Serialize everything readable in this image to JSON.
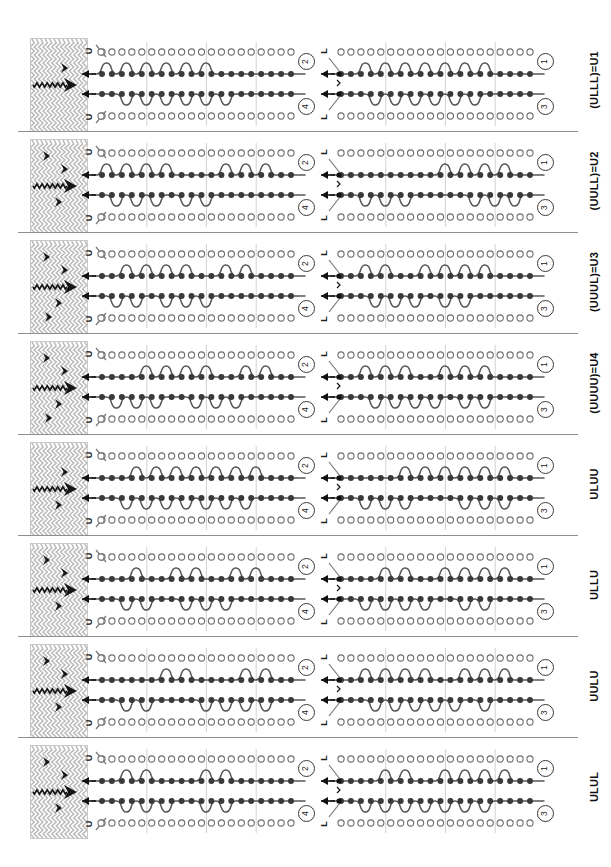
{
  "figure": {
    "kind": "knitting-bed-notation-diagram",
    "width": 611,
    "height": 867,
    "row_count": 8,
    "needles_per_row": 20,
    "beds_per_panel": 4,
    "colors": {
      "line": "#555555",
      "filled_needle": "#3a3a3a",
      "empty_needle": "#ffffff",
      "needle_outline": "#6e6e6e",
      "fabric_hatch": "#b9b9b9",
      "fabric_accent": "#151515",
      "separator": "#8e8e8e",
      "index_circle": "#3a3a3a"
    }
  },
  "panel_indices": {
    "left_top": "2",
    "left_bottom": "4",
    "right_top": "1",
    "right_bottom": "3"
  },
  "bed_markers": {
    "left_panel": [
      "U",
      "U"
    ],
    "right_panel": [
      "L",
      "L"
    ]
  },
  "rows": [
    {
      "label": "(ULLL)=U1",
      "left_panel": {
        "top_index": "2",
        "bottom_index": "4",
        "bed_marker_top": "U",
        "bed_marker_bottom": "U",
        "transfer_arrows": 2,
        "path_steps_top": [
          1,
          0,
          1,
          0,
          1,
          0,
          1,
          0,
          1,
          0,
          1,
          0,
          0,
          0,
          0,
          0,
          0,
          0,
          0,
          0
        ],
        "path_steps_bottom": [
          0,
          0,
          1,
          0,
          1,
          0,
          1,
          0,
          1,
          0,
          1,
          0,
          1,
          0,
          0,
          0,
          0,
          0,
          0,
          0
        ]
      },
      "right_panel": {
        "top_index": "1",
        "bottom_index": "3",
        "bed_marker_top": "L",
        "bed_marker_bottom": "L",
        "transfer_arrows": 2,
        "path_steps_top": [
          0,
          0,
          1,
          0,
          1,
          0,
          1,
          0,
          1,
          0,
          1,
          0,
          1,
          0,
          1,
          0,
          0,
          0,
          0,
          0
        ],
        "path_steps_bottom": [
          0,
          0,
          0,
          1,
          0,
          1,
          0,
          1,
          0,
          1,
          0,
          1,
          0,
          1,
          0,
          0,
          0,
          0,
          0,
          0
        ]
      },
      "fabric_accents": 1
    },
    {
      "label": "(UULL)=U2",
      "left_panel": {
        "top_index": "2",
        "bottom_index": "4",
        "bed_marker_top": "U",
        "bed_marker_bottom": "U",
        "transfer_arrows": 2,
        "path_steps_top": [
          1,
          0,
          1,
          0,
          1,
          0,
          1,
          0,
          0,
          0,
          0,
          0,
          1,
          0,
          1,
          0,
          1,
          0,
          0,
          0
        ],
        "path_steps_bottom": [
          0,
          1,
          0,
          1,
          0,
          1,
          0,
          0,
          1,
          0,
          1,
          0,
          0,
          0,
          0,
          0,
          0,
          0,
          0,
          0
        ]
      },
      "right_panel": {
        "top_index": "1",
        "bottom_index": "3",
        "bed_marker_top": "L",
        "bed_marker_bottom": "L",
        "transfer_arrows": 2,
        "path_steps_top": [
          0,
          0,
          0,
          0,
          0,
          0,
          0,
          0,
          0,
          0,
          1,
          0,
          1,
          0,
          1,
          0,
          1,
          0,
          0,
          0
        ],
        "path_steps_bottom": [
          0,
          0,
          1,
          0,
          1,
          0,
          1,
          0,
          0,
          0,
          0,
          0,
          0,
          1,
          0,
          1,
          0,
          1,
          0,
          0
        ]
      },
      "fabric_accents": 3
    },
    {
      "label": "(UUUL)=U3",
      "left_panel": {
        "top_index": "2",
        "bottom_index": "4",
        "bed_marker_top": "U",
        "bed_marker_bottom": "U",
        "transfer_arrows": 2,
        "path_steps_top": [
          0,
          0,
          1,
          0,
          1,
          0,
          1,
          0,
          1,
          0,
          0,
          0,
          1,
          0,
          1,
          0,
          0,
          0,
          0,
          0
        ],
        "path_steps_bottom": [
          0,
          1,
          0,
          1,
          0,
          0,
          1,
          0,
          1,
          0,
          1,
          0,
          0,
          0,
          0,
          0,
          0,
          0,
          0,
          0
        ]
      },
      "right_panel": {
        "top_index": "1",
        "bottom_index": "3",
        "bed_marker_top": "L",
        "bed_marker_bottom": "L",
        "transfer_arrows": 2,
        "path_steps_top": [
          0,
          0,
          1,
          0,
          1,
          0,
          0,
          0,
          1,
          0,
          1,
          0,
          1,
          0,
          1,
          0,
          0,
          0,
          0,
          0
        ],
        "path_steps_bottom": [
          0,
          0,
          0,
          1,
          0,
          1,
          0,
          1,
          0,
          0,
          1,
          0,
          1,
          0,
          0,
          0,
          0,
          0,
          0,
          0
        ]
      },
      "fabric_accents": 4
    },
    {
      "label": "(UUUU)=U4",
      "left_panel": {
        "top_index": "2",
        "bottom_index": "4",
        "bed_marker_top": "U",
        "bed_marker_bottom": "U",
        "transfer_arrows": 2,
        "path_steps_top": [
          0,
          0,
          0,
          0,
          1,
          0,
          1,
          0,
          1,
          0,
          1,
          0,
          0,
          0,
          1,
          0,
          1,
          0,
          0,
          0
        ],
        "path_steps_bottom": [
          0,
          1,
          0,
          1,
          0,
          1,
          0,
          0,
          0,
          1,
          0,
          1,
          0,
          1,
          0,
          0,
          0,
          0,
          0,
          0
        ]
      },
      "right_panel": {
        "top_index": "1",
        "bottom_index": "3",
        "bed_marker_top": "L",
        "bed_marker_bottom": "L",
        "transfer_arrows": 2,
        "path_steps_top": [
          0,
          0,
          1,
          0,
          1,
          0,
          1,
          0,
          0,
          0,
          1,
          0,
          1,
          0,
          1,
          0,
          0,
          0,
          0,
          0
        ],
        "path_steps_bottom": [
          0,
          0,
          0,
          1,
          0,
          1,
          0,
          1,
          0,
          1,
          0,
          0,
          1,
          0,
          1,
          0,
          0,
          0,
          0,
          0
        ]
      },
      "fabric_accents": 4
    },
    {
      "label": "ULUU",
      "left_panel": {
        "top_index": "2",
        "bottom_index": "4",
        "bed_marker_top": "U",
        "bed_marker_bottom": "U",
        "transfer_arrows": 2,
        "path_steps_top": [
          0,
          0,
          0,
          1,
          0,
          1,
          0,
          1,
          0,
          1,
          0,
          1,
          0,
          1,
          0,
          1,
          0,
          0,
          0,
          0
        ],
        "path_steps_bottom": [
          0,
          0,
          1,
          0,
          1,
          0,
          1,
          0,
          1,
          0,
          1,
          0,
          1,
          0,
          1,
          0,
          0,
          0,
          0,
          0
        ]
      },
      "right_panel": {
        "top_index": "1",
        "bottom_index": "3",
        "bed_marker_top": "L",
        "bed_marker_bottom": "L",
        "transfer_arrows": 2,
        "path_steps_top": [
          0,
          0,
          0,
          0,
          0,
          0,
          1,
          0,
          1,
          0,
          1,
          0,
          1,
          0,
          1,
          0,
          1,
          0,
          0,
          0
        ],
        "path_steps_bottom": [
          0,
          0,
          1,
          0,
          1,
          0,
          1,
          0,
          0,
          0,
          0,
          0,
          1,
          0,
          1,
          0,
          1,
          0,
          0,
          0
        ]
      },
      "fabric_accents": 2
    },
    {
      "label": "ULLU",
      "left_panel": {
        "top_index": "2",
        "bottom_index": "4",
        "bed_marker_top": "U",
        "bed_marker_bottom": "U",
        "transfer_arrows": 2,
        "path_steps_top": [
          0,
          0,
          0,
          1,
          0,
          0,
          0,
          1,
          0,
          1,
          0,
          0,
          0,
          1,
          0,
          1,
          0,
          0,
          0,
          0
        ],
        "path_steps_bottom": [
          0,
          0,
          1,
          0,
          1,
          0,
          0,
          0,
          1,
          0,
          1,
          0,
          1,
          0,
          0,
          0,
          0,
          0,
          0,
          0
        ]
      },
      "right_panel": {
        "top_index": "1",
        "bottom_index": "3",
        "bed_marker_top": "L",
        "bed_marker_bottom": "L",
        "transfer_arrows": 2,
        "path_steps_top": [
          0,
          0,
          0,
          0,
          1,
          0,
          1,
          0,
          0,
          0,
          1,
          0,
          1,
          0,
          1,
          0,
          1,
          0,
          0,
          0
        ],
        "path_steps_bottom": [
          0,
          0,
          1,
          0,
          1,
          0,
          1,
          0,
          1,
          0,
          0,
          0,
          1,
          0,
          1,
          0,
          0,
          0,
          0,
          0
        ]
      },
      "fabric_accents": 3
    },
    {
      "label": "UULU",
      "left_panel": {
        "top_index": "2",
        "bottom_index": "4",
        "bed_marker_top": "U",
        "bed_marker_bottom": "U",
        "transfer_arrows": 2,
        "path_steps_top": [
          0,
          0,
          0,
          0,
          0,
          0,
          1,
          0,
          1,
          0,
          0,
          0,
          0,
          0,
          1,
          0,
          1,
          0,
          0,
          0
        ],
        "path_steps_bottom": [
          0,
          0,
          1,
          0,
          1,
          0,
          0,
          0,
          0,
          0,
          1,
          0,
          1,
          0,
          1,
          0,
          1,
          0,
          0,
          0
        ]
      },
      "right_panel": {
        "top_index": "1",
        "bottom_index": "3",
        "bed_marker_top": "L",
        "bed_marker_bottom": "L",
        "transfer_arrows": 2,
        "path_steps_top": [
          0,
          0,
          1,
          0,
          1,
          0,
          1,
          0,
          1,
          0,
          0,
          0,
          1,
          0,
          1,
          0,
          1,
          0,
          0,
          0
        ],
        "path_steps_bottom": [
          0,
          0,
          0,
          1,
          0,
          1,
          0,
          1,
          0,
          1,
          0,
          1,
          0,
          0,
          1,
          0,
          0,
          0,
          0,
          0
        ]
      },
      "fabric_accents": 3
    },
    {
      "label": "ULUL",
      "left_panel": {
        "top_index": "2",
        "bottom_index": "4",
        "bed_marker_top": "U",
        "bed_marker_bottom": "U",
        "transfer_arrows": 2,
        "path_steps_top": [
          0,
          0,
          1,
          0,
          1,
          0,
          0,
          0,
          0,
          0,
          1,
          0,
          1,
          0,
          0,
          0,
          0,
          0,
          0,
          0
        ],
        "path_steps_bottom": [
          0,
          0,
          1,
          0,
          1,
          0,
          1,
          0,
          0,
          0,
          1,
          0,
          1,
          0,
          0,
          0,
          0,
          0,
          0,
          0
        ]
      },
      "right_panel": {
        "top_index": "1",
        "bottom_index": "3",
        "bed_marker_top": "L",
        "bed_marker_bottom": "L",
        "transfer_arrows": 2,
        "path_steps_top": [
          0,
          0,
          0,
          0,
          1,
          0,
          1,
          0,
          0,
          0,
          1,
          0,
          1,
          0,
          1,
          0,
          1,
          0,
          0,
          0
        ],
        "path_steps_bottom": [
          0,
          0,
          1,
          0,
          1,
          0,
          1,
          0,
          1,
          0,
          1,
          0,
          1,
          0,
          1,
          0,
          0,
          0,
          0,
          0
        ]
      },
      "fabric_accents": 3
    }
  ]
}
